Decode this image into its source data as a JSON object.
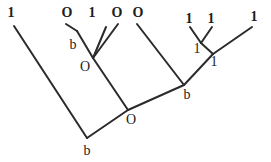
{
  "figure": {
    "name": "character-state-tree",
    "background_color": "#ffffff",
    "stroke_color": "#2b2b2b",
    "text_color": "#1d1d1d",
    "width": 271,
    "height": 162
  },
  "labels": {
    "tips": [
      {
        "id": "tip-1",
        "text": "1",
        "x": 11,
        "y": 13
      },
      {
        "id": "tip-2",
        "text": "O",
        "x": 67,
        "y": 13
      },
      {
        "id": "tip-3",
        "text": "1",
        "x": 92,
        "y": 13
      },
      {
        "id": "tip-4",
        "text": "O",
        "x": 117,
        "y": 13
      },
      {
        "id": "tip-5",
        "text": "O",
        "x": 138,
        "y": 13
      },
      {
        "id": "tip-6",
        "text": "1",
        "x": 189,
        "y": 19
      },
      {
        "id": "tip-7",
        "text": "1",
        "x": 211,
        "y": 19
      },
      {
        "id": "tip-8",
        "text": "1",
        "x": 254,
        "y": 17
      }
    ],
    "internal": [
      {
        "id": "node-b-left",
        "text": "b",
        "x": 73,
        "y": 45
      },
      {
        "id": "node-o-left",
        "text": "O",
        "x": 85,
        "y": 67
      },
      {
        "id": "node-1-right-upper",
        "text": "1",
        "x": 197,
        "y": 49
      },
      {
        "id": "node-1-right-lower",
        "text": "1",
        "x": 214,
        "y": 62
      },
      {
        "id": "node-b-right",
        "text": "b",
        "x": 187,
        "y": 95
      },
      {
        "id": "node-o-root-child",
        "text": "O",
        "x": 131,
        "y": 120
      },
      {
        "id": "node-b-root",
        "text": "b",
        "x": 87,
        "y": 151
      }
    ]
  },
  "branches": [
    {
      "id": "branch-root-to-tip1",
      "x1": 87,
      "y1": 138,
      "x2": 14,
      "y2": 26
    },
    {
      "id": "branch-root-to-o",
      "x1": 87,
      "y1": 138,
      "x2": 128,
      "y2": 110
    },
    {
      "id": "branch-o-to-oleft",
      "x1": 128,
      "y1": 110,
      "x2": 93,
      "y2": 58
    },
    {
      "id": "branch-o-to-bright",
      "x1": 128,
      "y1": 110,
      "x2": 184,
      "y2": 85
    },
    {
      "id": "branch-oleft-to-bleft",
      "x1": 93,
      "y1": 58,
      "x2": 77,
      "y2": 31
    },
    {
      "id": "branch-oleft-to-tip3",
      "x1": 93,
      "y1": 58,
      "x2": 106,
      "y2": 27
    },
    {
      "id": "branch-oleft-to-tip4",
      "x1": 93,
      "y1": 58,
      "x2": 118,
      "y2": 24
    },
    {
      "id": "branch-bleft-to-tip2",
      "x1": 77,
      "y1": 31,
      "x2": 66,
      "y2": 24
    },
    {
      "id": "branch-bright-to-tip5",
      "x1": 184,
      "y1": 85,
      "x2": 137,
      "y2": 24
    },
    {
      "id": "branch-bright-to-node1",
      "x1": 184,
      "y1": 85,
      "x2": 213,
      "y2": 54
    },
    {
      "id": "branch-node1-to-tip8",
      "x1": 213,
      "y1": 54,
      "x2": 252,
      "y2": 27
    },
    {
      "id": "branch-node1-to-node1upper",
      "x1": 213,
      "y1": 54,
      "x2": 201,
      "y2": 43
    },
    {
      "id": "branch-node1upper-to-tip6",
      "x1": 201,
      "y1": 43,
      "x2": 190,
      "y2": 27
    },
    {
      "id": "branch-node1upper-to-tip7",
      "x1": 201,
      "y1": 43,
      "x2": 212,
      "y2": 27
    }
  ]
}
